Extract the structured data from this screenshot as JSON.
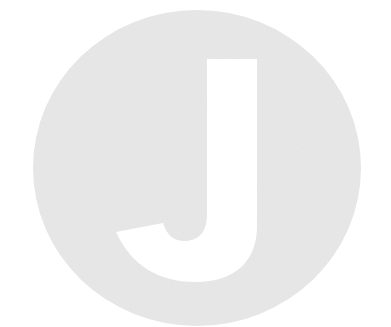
{
  "logo": {
    "letter": "J",
    "circle_color": "#e9e9e9",
    "letter_color": "#ffffff",
    "background_color": "#ffffff"
  }
}
